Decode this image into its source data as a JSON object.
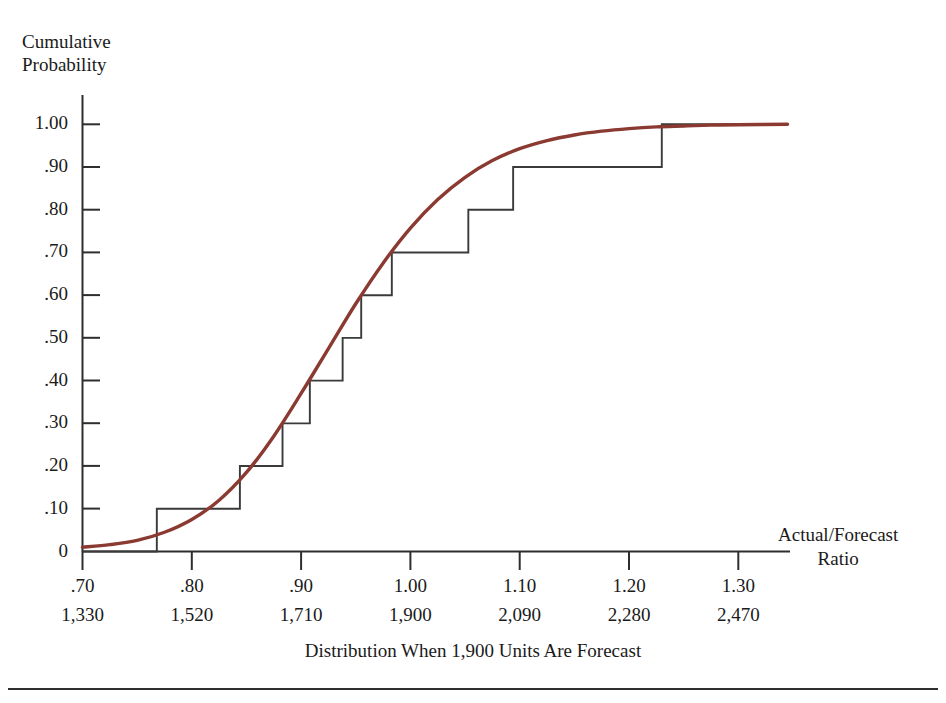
{
  "page": {
    "header_text": "",
    "folio": ""
  },
  "figure": {
    "y_axis_title_line1": "Cumulative",
    "y_axis_title_line2": "Probability",
    "x_axis_title_line1": "Actual/Forecast",
    "x_axis_title_line2": "Ratio",
    "caption": "Distribution When 1,900 Units Are Forecast"
  },
  "colors": {
    "curve": "#8B3A32",
    "step": "#3a3a3a",
    "axis": "#2e2e2e",
    "text": "#1a1a1a",
    "background": "#ffffff"
  },
  "chart_data": {
    "type": "line",
    "title": "Distribution When 1,900 Units Are Forecast",
    "xlabel": "Actual/Forecast Ratio",
    "ylabel": "Cumulative Probability",
    "xlim": [
      0.7,
      1.345
    ],
    "ylim": [
      0.0,
      1.0
    ],
    "grid": false,
    "legend": "none",
    "x_ticks": [
      0.7,
      0.8,
      0.9,
      1.0,
      1.1,
      1.2,
      1.3
    ],
    "x_tick_labels": [
      ".70",
      ".80",
      ".90",
      "1.00",
      "1.10",
      "1.20",
      "1.30"
    ],
    "x_ticks_secondary_labels": [
      "1,330",
      "1,520",
      "1,710",
      "1,900",
      "2,090",
      "2,280",
      "2,470"
    ],
    "y_ticks": [
      0.0,
      0.1,
      0.2,
      0.3,
      0.4,
      0.5,
      0.6,
      0.7,
      0.8,
      0.9,
      1.0
    ],
    "y_tick_labels": [
      "0",
      ".10",
      ".20",
      ".30",
      ".40",
      ".50",
      ".60",
      ".70",
      ".80",
      ".90",
      "1.00"
    ],
    "forecast_units": 1900,
    "series": [
      {
        "name": "Empirical step distribution",
        "type": "step",
        "color": "#3a3a3a",
        "step_x": [
          0.768,
          0.844,
          0.883,
          0.908,
          0.938,
          0.955,
          0.983,
          1.053,
          1.094,
          1.23
        ],
        "step_y": [
          0.1,
          0.2,
          0.3,
          0.4,
          0.5,
          0.6,
          0.7,
          0.8,
          0.9,
          1.0
        ]
      },
      {
        "name": "Fitted smooth cumulative curve",
        "type": "line",
        "color": "#8B3A32",
        "x": [
          0.7,
          0.725,
          0.75,
          0.775,
          0.8,
          0.825,
          0.85,
          0.875,
          0.9,
          0.925,
          0.95,
          0.975,
          1.0,
          1.025,
          1.05,
          1.075,
          1.1,
          1.125,
          1.15,
          1.175,
          1.2,
          1.225,
          1.25,
          1.275,
          1.3,
          1.345
        ],
        "y": [
          0.01,
          0.016,
          0.026,
          0.045,
          0.075,
          0.12,
          0.185,
          0.27,
          0.37,
          0.475,
          0.58,
          0.675,
          0.757,
          0.824,
          0.876,
          0.915,
          0.943,
          0.962,
          0.975,
          0.984,
          0.99,
          0.994,
          0.996,
          0.998,
          0.999,
          1.0
        ]
      }
    ]
  }
}
